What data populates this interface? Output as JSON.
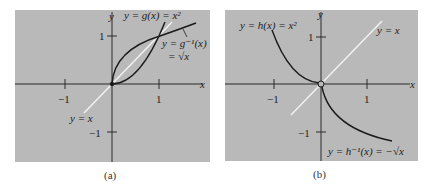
{
  "panels": [
    {
      "id": "a",
      "caption": "(a)",
      "axis_x_label": "x",
      "axis_y_label": "y",
      "tick_x_neg": "−1",
      "tick_x_pos": "1",
      "tick_y_pos": "1",
      "tick_y_neg": "−1",
      "curve_label_main": "y = g(x) = x²",
      "curve_label_inverse_line1": "y = g⁻¹(x)",
      "curve_label_inverse_line2": "= √x",
      "diagonal_label": "y = x"
    },
    {
      "id": "b",
      "caption": "(b)",
      "axis_x_label": "x",
      "axis_y_label": "y",
      "tick_x_neg": "−1",
      "tick_x_pos": "1",
      "tick_y_pos": "1",
      "tick_y_neg": "−1",
      "curve_label_main": "y = h(x) = x²",
      "curve_label_inverse": "y = h⁻¹(x) = −√x",
      "diagonal_label": "y = x"
    }
  ],
  "colors": {
    "panel_bg": "#b9b9b9",
    "axis": "#2a2a2a",
    "curve": "#1a1a1a",
    "diagonal": "#f2f2f2"
  }
}
